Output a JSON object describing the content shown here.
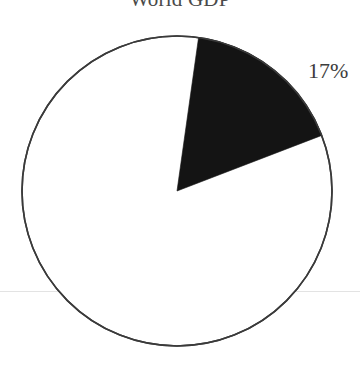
{
  "page": {
    "background_color": "#ffffff",
    "width": 360,
    "height": 366
  },
  "chart_title": "World GDP",
  "slice_label": "17%",
  "scan_artifact": {
    "name": "horizontal-seam",
    "color": "#e3e3e3",
    "y": 291
  },
  "chart_data": {
    "type": "pie",
    "title": "World GDP",
    "xlabel": "",
    "ylabel": "",
    "categories": [
      "Highlighted share",
      "Remainder"
    ],
    "values": [
      17,
      83
    ],
    "labels": [
      "17%",
      ""
    ],
    "colors": [
      "#141414",
      "#ffffff"
    ],
    "legend": "none",
    "grid": false,
    "annotations": [
      "17%"
    ],
    "geometry": {
      "center_x": 177,
      "center_y": 191,
      "radius": 155,
      "start_angle_deg": 8,
      "sweep_angle_deg": 61,
      "direction": "clockwise",
      "stroke_color": "#3a3a3a",
      "stroke_width": 1.6
    }
  }
}
